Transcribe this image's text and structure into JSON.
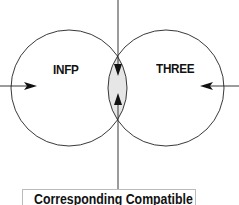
{
  "diagram": {
    "left_circle": {
      "label": "INFP"
    },
    "right_circle": {
      "label": "THREE"
    },
    "overlap_fill": "#e6e6e6",
    "result_box": {
      "label": "Corresponding Compatible"
    }
  }
}
